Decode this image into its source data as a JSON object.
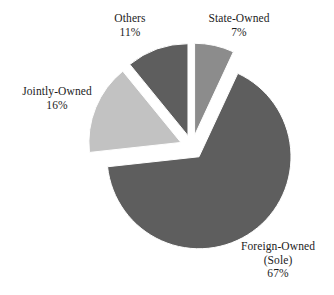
{
  "chart_data": {
    "type": "pie",
    "title": "",
    "subtitle": "",
    "xlabel": "",
    "ylabel": "",
    "legend_position": "none",
    "grid": false,
    "exploded": true,
    "labels_show_percent": true,
    "categories": [
      "State-Owned",
      "Foreign-Owned (Sole)",
      "Jointly-Owned",
      "Others"
    ],
    "values": [
      7,
      16,
      11,
      67
    ],
    "slices": [
      {
        "id": "state-owned",
        "label": "State-Owned",
        "sublabel": "",
        "value": 7,
        "percent_text": "7%",
        "color": "#8c8c8c"
      },
      {
        "id": "foreign-owned-sole",
        "label": "Foreign-Owned",
        "sublabel": "(Sole)",
        "value": 67,
        "percent_text": "67%",
        "color": "#5e5e5e"
      },
      {
        "id": "jointly-owned",
        "label": "Jointly-Owned",
        "sublabel": "",
        "value": 16,
        "percent_text": "16%",
        "color": "#c2c2c2"
      },
      {
        "id": "others",
        "label": "Others",
        "sublabel": "",
        "value": 11,
        "percent_text": "11%",
        "color": "#5e5e5e"
      }
    ],
    "colors": {
      "background": "#ffffff",
      "dark_gray": "#5e5e5e",
      "medium_gray": "#8c8c8c",
      "light_gray": "#c2c2c2",
      "text": "#1c1c1c"
    }
  }
}
